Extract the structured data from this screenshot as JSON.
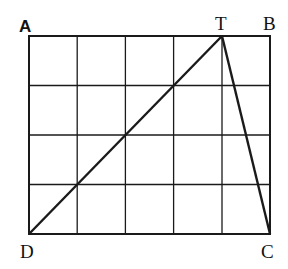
{
  "diagram": {
    "grid": {
      "cols": 5,
      "rows": 4,
      "left": 29,
      "top": 36,
      "right": 270,
      "bottom": 234
    },
    "points": {
      "A": {
        "label": "A",
        "x": 29,
        "y": 36
      },
      "B": {
        "label": "B",
        "x": 270,
        "y": 36
      },
      "C": {
        "label": "C",
        "x": 270,
        "y": 234
      },
      "D": {
        "label": "D",
        "x": 29,
        "y": 234
      },
      "T": {
        "label": "T",
        "x": 222,
        "y": 36
      }
    },
    "segments": [
      {
        "from": "D",
        "to": "T"
      },
      {
        "from": "T",
        "to": "C"
      }
    ],
    "stroke_color": "#1a1a1a"
  }
}
